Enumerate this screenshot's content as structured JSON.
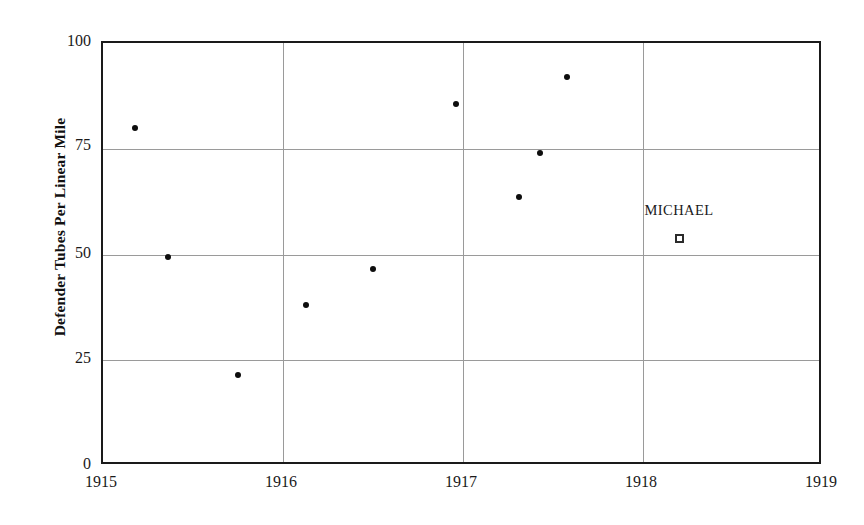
{
  "chart_data": {
    "type": "scatter",
    "title": "",
    "xlabel": "",
    "ylabel": "Defender Tubes Per Linear Mile",
    "xlim": [
      1915,
      1919
    ],
    "ylim": [
      0,
      100
    ],
    "grid": true,
    "legend": "none",
    "xticks": [
      "1915",
      "1916",
      "1917",
      "1918",
      "1919"
    ],
    "xtick_values": [
      1915,
      1916,
      1917,
      1918,
      1919
    ],
    "yticks": [
      "0",
      "25",
      "50",
      "75",
      "100"
    ],
    "ytick_values": [
      0,
      25,
      50,
      75,
      100
    ],
    "series": [
      {
        "name": "observations",
        "marker": "filled-circle",
        "color": "#0d0d0d",
        "points": [
          {
            "x": 1915.18,
            "y": 80.0
          },
          {
            "x": 1915.36,
            "y": 49.5
          },
          {
            "x": 1915.75,
            "y": 21.5
          },
          {
            "x": 1916.13,
            "y": 38.0
          },
          {
            "x": 1916.5,
            "y": 46.5
          },
          {
            "x": 1916.96,
            "y": 85.5
          },
          {
            "x": 1917.31,
            "y": 63.5
          },
          {
            "x": 1917.43,
            "y": 74.0
          },
          {
            "x": 1917.58,
            "y": 92.0
          }
        ]
      },
      {
        "name": "MICHAEL",
        "marker": "open-square",
        "color": "#2b2b2b",
        "points": [
          {
            "x": 1918.2,
            "y": 53.7,
            "label": "MICHAEL"
          }
        ]
      }
    ],
    "annotations": [
      {
        "text": "MICHAEL",
        "x": 1918.2,
        "y": 60.5
      }
    ]
  },
  "axis": {
    "y_title": "Defender Tubes Per Linear Mile",
    "y_labels": [
      "100",
      "75",
      "50",
      "25",
      "0"
    ],
    "x_labels": [
      "1915",
      "1916",
      "1917",
      "1918",
      "1919"
    ]
  },
  "colors": {
    "frame": "#1a1a1a",
    "gridline": "#9a9a9a",
    "marker": "#0d0d0d",
    "background": "#ffffff",
    "text": "#1a1a1a"
  }
}
